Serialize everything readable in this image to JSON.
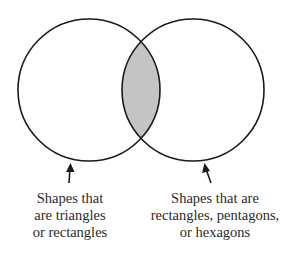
{
  "diagram": {
    "type": "venn",
    "shading_color": "#c4c4c4",
    "stroke_color": "#1a1a1a",
    "sets": [
      {
        "name": "left-set",
        "label_lines": [
          "Shapes that",
          "are triangles",
          "or rectangles"
        ]
      },
      {
        "name": "right-set",
        "label_lines": [
          "Shapes that are",
          "rectangles, pentagons,",
          "or hexagons"
        ]
      }
    ],
    "shaded_region": "intersection"
  }
}
